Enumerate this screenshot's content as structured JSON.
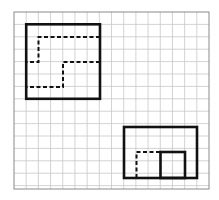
{
  "diagram": {
    "title": "",
    "type": "grid-paper-figures",
    "grid": {
      "columns": 16,
      "rows": 14,
      "line_color": "#c8c8c8",
      "border_color": "#8a8a8a"
    },
    "ink_color": "#111111",
    "figures": [
      {
        "name": "figure-1",
        "outline": "solid rectangle",
        "dashed_paths": 2,
        "description": "Square divided by two dashed step-shaped lines into three regions"
      },
      {
        "name": "figure-2",
        "outline": "solid rectangle",
        "inner_solid_square": true,
        "dashed_paths": 1,
        "description": "Rectangle with a solid inner square at the bottom and a dashed square outline to its left"
      }
    ]
  }
}
